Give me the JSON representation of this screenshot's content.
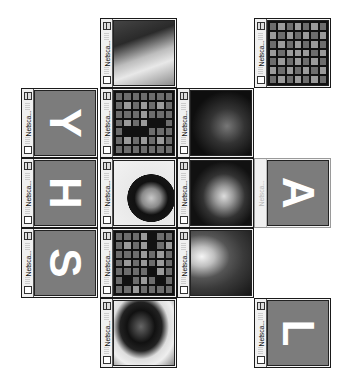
{
  "window_title": "Netsca...",
  "tiles": [
    {
      "id": "c1r0",
      "type": "photo",
      "desc": "face-with-cap",
      "left": 100,
      "top": 18,
      "active": true,
      "bg": "linear-gradient(160deg,#444 0%,#2a2a2a 30%,#bdbdbd 55%,#e8e8e8 70%,#8c8c8c 100%)"
    },
    {
      "id": "c3r0",
      "type": "grid",
      "left": 254,
      "top": 18,
      "active": true,
      "cells": "mlmlmlm lmlmlml mlmlmlm lmlllml mlmlmlm lmlmlml mlmlmlm"
    },
    {
      "id": "c0r1",
      "type": "letter",
      "letter": "Y",
      "left": 21,
      "top": 88,
      "active": true
    },
    {
      "id": "c1r1",
      "type": "grid",
      "left": 100,
      "top": 88,
      "active": true,
      "cells": "mmmmmmm mlmlmlm mmmlmmm mlmlddm mdddmmm mlmlmlm mmmmmmm"
    },
    {
      "id": "c2r1",
      "type": "photo",
      "desc": "leopard-print-hat",
      "left": 177,
      "top": 88,
      "active": true,
      "bg": "radial-gradient(circle at 60% 55%,#777 0%,#333 35%,#0e0e0e 70%),linear-gradient(120deg,#ddd 0%,#222 30%)"
    },
    {
      "id": "c0r2",
      "type": "letter",
      "letter": "H",
      "left": 21,
      "top": 158,
      "active": true
    },
    {
      "id": "c1r2",
      "type": "photo",
      "desc": "woman-dark-hair",
      "left": 100,
      "top": 158,
      "active": true,
      "bg": "radial-gradient(ellipse at 62% 58%,#c8c8c8 0%,#8a8a8a 18%,#111 32%,#151515 45%,#e9e9e9 46%,#f2f2f2 100%)"
    },
    {
      "id": "c2r2",
      "type": "photo",
      "desc": "leopard-print-face",
      "left": 177,
      "top": 158,
      "active": true,
      "bg": "radial-gradient(ellipse at 55% 55%,#ddd 0%,#999 20%,#333 45%,#111 70%)"
    },
    {
      "id": "c3r2",
      "type": "letter",
      "letter": "A",
      "left": 254,
      "top": 158,
      "active": false
    },
    {
      "id": "c0r3",
      "type": "letter",
      "letter": "S",
      "left": 21,
      "top": 228,
      "active": true
    },
    {
      "id": "c1r3",
      "type": "grid",
      "left": 100,
      "top": 228,
      "active": true,
      "cells": "mmmldmm mlmldml mmmlmlm mlmlmlm mmmmdlm mdmlmdm mmlmmmm"
    },
    {
      "id": "c2r3",
      "type": "photo",
      "desc": "glowing-lips",
      "left": 177,
      "top": 228,
      "active": true,
      "bg": "radial-gradient(ellipse at 18% 40%,#f5f5f5 0%,#bfbfbf 18%,#555 40%,#3a3a3a 60%,#151515 100%)"
    },
    {
      "id": "c1r4",
      "type": "photo",
      "desc": "person-dark-glasses",
      "left": 100,
      "top": 298,
      "active": true,
      "bg": "radial-gradient(ellipse at 45% 40%,#666 0%,#111 30%,#222 45%,#ddd 60%,#eee 75%,#888 100%)"
    },
    {
      "id": "c3r4",
      "type": "letter",
      "letter": "L",
      "left": 254,
      "top": 298,
      "active": true
    }
  ],
  "icons": {
    "zoom_box": "zoom-box-icon",
    "close_box": "close-box-icon"
  },
  "colors": {
    "letter_panel": "#7c7c7c",
    "grid_bg": "#111111",
    "cell_mid": "#6d6d6d",
    "cell_light": "#9a9a9a"
  }
}
